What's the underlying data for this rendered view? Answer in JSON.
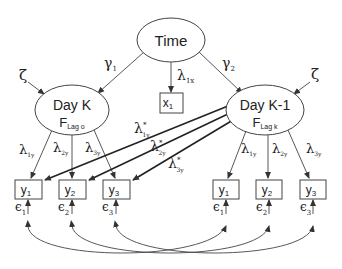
{
  "diagram": {
    "type": "structural equation path diagram",
    "nodes": {
      "time": {
        "label": "Time"
      },
      "day_k": {
        "label": "Day K",
        "sub_main": "F",
        "sub_text": "Lag o"
      },
      "day_k1": {
        "label": "Day K-1",
        "sub_main": "F",
        "sub_text": "Lag k"
      },
      "x1": {
        "label": "x",
        "sub": "1"
      },
      "left_y": [
        {
          "label": "y",
          "sub": "1"
        },
        {
          "label": "y",
          "sub": "2"
        },
        {
          "label": "y",
          "sub": "3"
        }
      ],
      "right_y": [
        {
          "label": "y",
          "sub": "1"
        },
        {
          "label": "y",
          "sub": "2"
        },
        {
          "label": "y",
          "sub": "3"
        }
      ]
    },
    "edge_labels": {
      "gamma1": {
        "main": "γ",
        "sub": "1"
      },
      "gamma2": {
        "main": "γ",
        "sub": "2"
      },
      "lambda1x": {
        "main": "λ",
        "sub": "1x"
      },
      "zeta_left": "ζ",
      "zeta_right": "ζ",
      "left_lambdas": [
        {
          "main": "λ",
          "sub": "1y"
        },
        {
          "main": "λ",
          "sub": "2y"
        },
        {
          "main": "λ",
          "sub": "3y"
        }
      ],
      "right_lambdas": [
        {
          "main": "λ",
          "sub": "1y"
        },
        {
          "main": "λ",
          "sub": "2y"
        },
        {
          "main": "λ",
          "sub": "3y"
        }
      ],
      "cross_lambdas": [
        {
          "main": "λ",
          "sup": "*",
          "sub": "1y"
        },
        {
          "main": "λ",
          "sup": "*",
          "sub": "2y"
        },
        {
          "main": "λ",
          "sup": "*",
          "sub": "3y"
        }
      ],
      "left_eps": [
        {
          "main": "ϵ",
          "sub": "1"
        },
        {
          "main": "ϵ",
          "sub": "2"
        },
        {
          "main": "ϵ",
          "sub": "3"
        }
      ],
      "right_eps": [
        {
          "main": "ϵ",
          "sub": "1"
        },
        {
          "main": "ϵ",
          "sub": "2"
        },
        {
          "main": "ϵ",
          "sub": "3"
        }
      ]
    },
    "colors": {
      "stroke": "#444444",
      "text": "#222222",
      "background": "#ffffff"
    }
  }
}
